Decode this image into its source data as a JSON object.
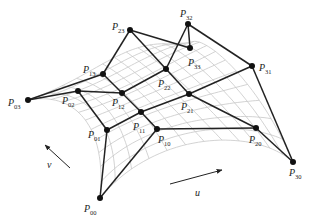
{
  "diagram": {
    "type": "bicubic-bezier-patch-control-net",
    "colors": {
      "net": "#222222",
      "surface_grid": "#c8c8c8",
      "point": "#111111",
      "label": "#222222"
    },
    "points": [
      {
        "id": "P00",
        "base": "P",
        "sub": "00",
        "x": 100,
        "y": 198,
        "lx": 84,
        "ly": 212
      },
      {
        "id": "P01",
        "base": "P",
        "sub": "01",
        "x": 107,
        "y": 130,
        "lx": 88,
        "ly": 138
      },
      {
        "id": "P02",
        "base": "P",
        "sub": "02",
        "x": 78,
        "y": 91,
        "lx": 62,
        "ly": 104
      },
      {
        "id": "P03",
        "base": "P",
        "sub": "03",
        "x": 28,
        "y": 100,
        "lx": 8,
        "ly": 106
      },
      {
        "id": "P10",
        "base": "P",
        "sub": "10",
        "x": 157,
        "y": 129,
        "lx": 158,
        "ly": 143
      },
      {
        "id": "P11",
        "base": "P",
        "sub": "11",
        "x": 141,
        "y": 112,
        "lx": 133,
        "ly": 130
      },
      {
        "id": "P12",
        "base": "P",
        "sub": "12",
        "x": 122,
        "y": 93,
        "lx": 112,
        "ly": 106
      },
      {
        "id": "P13",
        "base": "P",
        "sub": "13",
        "x": 103,
        "y": 74,
        "lx": 83,
        "ly": 73
      },
      {
        "id": "P20",
        "base": "P",
        "sub": "20",
        "x": 256,
        "y": 128,
        "lx": 249,
        "ly": 143
      },
      {
        "id": "P21",
        "base": "P",
        "sub": "21",
        "x": 189,
        "y": 94,
        "lx": 181,
        "ly": 110
      },
      {
        "id": "P22",
        "base": "P",
        "sub": "22",
        "x": 166,
        "y": 69,
        "lx": 158,
        "ly": 87
      },
      {
        "id": "P23",
        "base": "P",
        "sub": "23",
        "x": 130,
        "y": 30,
        "lx": 112,
        "ly": 30
      },
      {
        "id": "P30",
        "base": "P",
        "sub": "30",
        "x": 293,
        "y": 162,
        "lx": 289,
        "ly": 176
      },
      {
        "id": "P31",
        "base": "P",
        "sub": "31",
        "x": 252,
        "y": 66,
        "lx": 259,
        "ly": 71
      },
      {
        "id": "P32",
        "base": "P",
        "sub": "32",
        "x": 188,
        "y": 24,
        "lx": 180,
        "ly": 17
      },
      {
        "id": "P33",
        "base": "P",
        "sub": "33",
        "x": 190,
        "y": 48,
        "lx": 188,
        "ly": 66
      }
    ],
    "edges": [
      [
        "P00",
        "P01"
      ],
      [
        "P01",
        "P02"
      ],
      [
        "P02",
        "P03"
      ],
      [
        "P10",
        "P11"
      ],
      [
        "P11",
        "P12"
      ],
      [
        "P12",
        "P13"
      ],
      [
        "P20",
        "P21"
      ],
      [
        "P21",
        "P22"
      ],
      [
        "P22",
        "P23"
      ],
      [
        "P30",
        "P31"
      ],
      [
        "P31",
        "P32"
      ],
      [
        "P32",
        "P33"
      ],
      [
        "P00",
        "P10"
      ],
      [
        "P10",
        "P20"
      ],
      [
        "P20",
        "P30"
      ],
      [
        "P01",
        "P11"
      ],
      [
        "P11",
        "P21"
      ],
      [
        "P21",
        "P31"
      ],
      [
        "P02",
        "P12"
      ],
      [
        "P12",
        "P22"
      ],
      [
        "P22",
        "P32"
      ],
      [
        "P03",
        "P13"
      ],
      [
        "P13",
        "P23"
      ],
      [
        "P23",
        "P33"
      ]
    ],
    "axes": [
      {
        "label": "u",
        "x1": 170,
        "y1": 184,
        "x2": 222,
        "y2": 170,
        "lx": 195,
        "ly": 196
      },
      {
        "label": "v",
        "x1": 70,
        "y1": 168,
        "x2": 45,
        "y2": 145,
        "lx": 47,
        "ly": 168
      }
    ]
  }
}
